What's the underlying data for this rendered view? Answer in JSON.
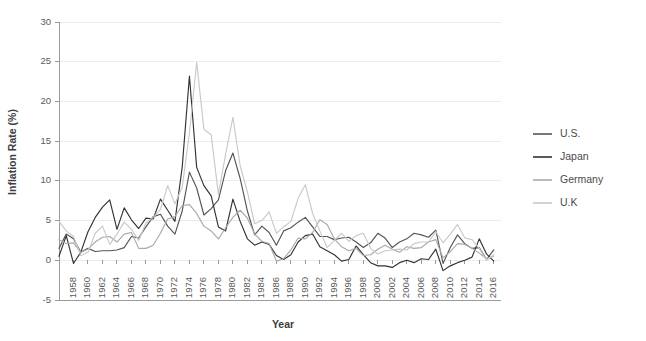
{
  "chart_data": {
    "type": "line",
    "title": "",
    "xlabel": "Year",
    "ylabel": "Inflation Rate (%)",
    "xlim": [
      1956,
      2017
    ],
    "ylim": [
      -5,
      30
    ],
    "yticks": [
      -5,
      0,
      5,
      10,
      15,
      20,
      25,
      30
    ],
    "xticks": [
      1958,
      1960,
      1962,
      1964,
      1966,
      1968,
      1970,
      1972,
      1974,
      1976,
      1978,
      1980,
      1982,
      1984,
      1986,
      1988,
      1990,
      1992,
      1994,
      1996,
      1998,
      2000,
      2002,
      2004,
      2006,
      2008,
      2010,
      2012,
      2014,
      2016
    ],
    "grid": "horizontal",
    "legend_position": "right",
    "x": [
      1956,
      1957,
      1958,
      1959,
      1960,
      1961,
      1962,
      1963,
      1964,
      1965,
      1966,
      1967,
      1968,
      1969,
      1970,
      1971,
      1972,
      1973,
      1974,
      1975,
      1976,
      1977,
      1978,
      1979,
      1980,
      1981,
      1982,
      1983,
      1984,
      1985,
      1986,
      1987,
      1988,
      1989,
      1990,
      1991,
      1992,
      1993,
      1994,
      1995,
      1996,
      1997,
      1998,
      1999,
      2000,
      2001,
      2002,
      2003,
      2004,
      2005,
      2006,
      2007,
      2008,
      2009,
      2010,
      2011,
      2012,
      2013,
      2014,
      2015,
      2016
    ],
    "series": [
      {
        "name": "U.S.",
        "color": "#555555",
        "values": [
          1.5,
          3.3,
          2.7,
          1.0,
          1.5,
          1.1,
          1.2,
          1.2,
          1.3,
          1.6,
          3.0,
          2.8,
          4.2,
          5.5,
          5.8,
          4.3,
          3.3,
          6.2,
          11.1,
          9.1,
          5.7,
          6.5,
          7.6,
          11.3,
          13.5,
          10.3,
          6.2,
          3.2,
          4.3,
          3.5,
          1.9,
          3.7,
          4.1,
          4.8,
          5.4,
          4.2,
          3.0,
          3.0,
          2.6,
          2.8,
          2.9,
          2.3,
          1.6,
          2.2,
          3.4,
          2.8,
          1.6,
          2.3,
          2.7,
          3.4,
          3.2,
          2.9,
          3.8,
          -0.4,
          1.6,
          3.2,
          2.1,
          1.5,
          1.6,
          0.1,
          1.3
        ]
      },
      {
        "name": "Japan",
        "color": "#333333",
        "values": [
          0.5,
          3.1,
          -0.4,
          1.0,
          3.6,
          5.4,
          6.7,
          7.6,
          3.9,
          6.6,
          5.1,
          4.0,
          5.3,
          5.2,
          7.7,
          6.3,
          4.9,
          11.7,
          23.2,
          11.7,
          9.4,
          8.1,
          4.2,
          3.7,
          7.7,
          4.9,
          2.7,
          1.9,
          2.3,
          2.0,
          0.6,
          0.1,
          0.7,
          2.3,
          3.1,
          3.3,
          1.7,
          1.2,
          0.7,
          -0.1,
          0.1,
          1.8,
          0.7,
          -0.3,
          -0.7,
          -0.7,
          -0.9,
          -0.3,
          0.0,
          -0.3,
          0.2,
          0.1,
          1.4,
          -1.3,
          -0.7,
          -0.3,
          0.0,
          0.4,
          2.7,
          0.8,
          -0.1
        ]
      },
      {
        "name": "Germany",
        "color": "#aaaaaa",
        "values": [
          2.6,
          2.1,
          2.2,
          1.0,
          1.4,
          2.3,
          2.9,
          3.0,
          2.3,
          3.3,
          3.5,
          1.5,
          1.5,
          1.9,
          3.4,
          5.2,
          5.5,
          6.9,
          7.0,
          5.9,
          4.3,
          3.7,
          2.7,
          4.1,
          5.4,
          6.3,
          5.3,
          3.3,
          2.4,
          2.1,
          -0.1,
          0.2,
          1.3,
          2.8,
          2.7,
          3.5,
          5.1,
          4.5,
          2.7,
          1.7,
          1.2,
          1.5,
          0.6,
          0.7,
          1.4,
          1.9,
          1.4,
          1.0,
          1.7,
          1.5,
          1.6,
          2.3,
          2.6,
          0.3,
          1.1,
          2.1,
          2.0,
          1.5,
          0.9,
          0.2,
          0.5
        ]
      },
      {
        "name": "U.K",
        "color": "#c9c9c9",
        "values": [
          4.9,
          3.7,
          3.0,
          0.6,
          1.0,
          3.4,
          4.3,
          2.0,
          3.3,
          4.8,
          3.9,
          2.5,
          4.7,
          5.4,
          6.4,
          9.4,
          7.1,
          9.2,
          16.0,
          24.9,
          16.5,
          15.8,
          8.3,
          13.4,
          18.0,
          11.9,
          8.6,
          4.6,
          5.0,
          6.1,
          3.4,
          4.2,
          4.9,
          7.8,
          9.5,
          5.9,
          3.7,
          1.6,
          2.5,
          3.4,
          2.4,
          3.1,
          3.4,
          1.5,
          0.8,
          1.2,
          1.3,
          1.4,
          1.3,
          2.1,
          2.3,
          2.3,
          3.6,
          2.2,
          3.3,
          4.5,
          2.8,
          2.6,
          1.5,
          0.0,
          0.7
        ]
      }
    ]
  },
  "legend": {
    "entries": [
      {
        "label": "U.S."
      },
      {
        "label": "Japan"
      },
      {
        "label": "Germany"
      },
      {
        "label": "U.K"
      }
    ]
  }
}
